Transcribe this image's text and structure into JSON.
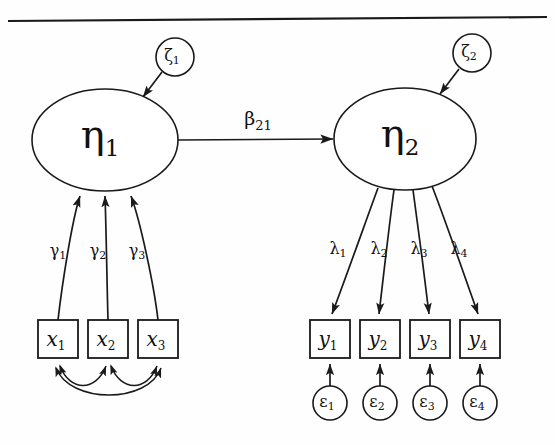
{
  "figure": {
    "type": "sem-path-diagram",
    "top_rule": true,
    "background_color": "#fefefe",
    "stroke_color": "#1a1a1a"
  },
  "latent_variables": [
    {
      "id": "eta1",
      "symbol": "η",
      "subscript": "1",
      "shape": "ellipse",
      "cx": 105,
      "cy": 140,
      "rx": 73,
      "ry": 51
    },
    {
      "id": "eta2",
      "symbol": "η",
      "subscript": "2",
      "shape": "ellipse",
      "cx": 405,
      "cy": 139,
      "rx": 71,
      "ry": 51
    }
  ],
  "disturbances": [
    {
      "id": "zeta1",
      "symbol": "ζ",
      "subscript": "1",
      "shape": "circle",
      "cx": 175,
      "cy": 57,
      "r": 19,
      "target": "eta1"
    },
    {
      "id": "zeta2",
      "symbol": "ζ",
      "subscript": "2",
      "shape": "circle",
      "cx": 472,
      "cy": 53,
      "r": 19,
      "target": "eta2"
    }
  ],
  "exogenous_indicators": [
    {
      "id": "x1",
      "symbol": "x",
      "subscript": "1",
      "x": 38,
      "y": 320,
      "w": 40,
      "h": 38
    },
    {
      "id": "x2",
      "symbol": "x",
      "subscript": "2",
      "x": 88,
      "y": 320,
      "w": 40,
      "h": 38
    },
    {
      "id": "x3",
      "symbol": "x",
      "subscript": "3",
      "x": 138,
      "y": 320,
      "w": 40,
      "h": 38
    }
  ],
  "endogenous_indicators": [
    {
      "id": "y1",
      "symbol": "y",
      "subscript": "1",
      "x": 310,
      "y": 320,
      "w": 40,
      "h": 38
    },
    {
      "id": "y2",
      "symbol": "y",
      "subscript": "2",
      "x": 360,
      "y": 320,
      "w": 40,
      "h": 38
    },
    {
      "id": "y3",
      "symbol": "y",
      "subscript": "3",
      "x": 410,
      "y": 320,
      "w": 40,
      "h": 38
    },
    {
      "id": "y4",
      "symbol": "y",
      "subscript": "4",
      "x": 460,
      "y": 320,
      "w": 40,
      "h": 38
    }
  ],
  "measurement_errors": [
    {
      "id": "epsilon1",
      "symbol": "ε",
      "subscript": "1",
      "cx": 330,
      "cy": 403,
      "r": 17,
      "target": "y1"
    },
    {
      "id": "epsilon2",
      "symbol": "ε",
      "subscript": "2",
      "cx": 380,
      "cy": 403,
      "r": 17,
      "target": "y2"
    },
    {
      "id": "epsilon3",
      "symbol": "ε",
      "subscript": "3",
      "cx": 430,
      "cy": 403,
      "r": 17,
      "target": "y3"
    },
    {
      "id": "epsilon4",
      "symbol": "ε",
      "subscript": "4",
      "cx": 480,
      "cy": 403,
      "r": 17,
      "target": "y4"
    }
  ],
  "gamma_paths": [
    {
      "id": "gamma1",
      "symbol": "γ",
      "subscript": "1",
      "from": "x1",
      "to": "eta1",
      "label_x": 58,
      "label_y": 251
    },
    {
      "id": "gamma2",
      "symbol": "γ",
      "subscript": "2",
      "from": "x2",
      "to": "eta1",
      "label_x": 98,
      "label_y": 251
    },
    {
      "id": "gamma3",
      "symbol": "γ",
      "subscript": "3",
      "from": "x3",
      "to": "eta1",
      "label_x": 137,
      "label_y": 251
    }
  ],
  "lambda_paths": [
    {
      "id": "lambda1",
      "symbol": "λ",
      "subscript": "1",
      "from": "eta2",
      "to": "y1",
      "label_x": 338,
      "label_y": 249
    },
    {
      "id": "lambda2",
      "symbol": "λ",
      "subscript": "2",
      "from": "eta2",
      "to": "y2",
      "label_x": 379,
      "label_y": 249
    },
    {
      "id": "lambda3",
      "symbol": "λ",
      "subscript": "3",
      "from": "eta2",
      "to": "y3",
      "label_x": 419,
      "label_y": 249
    },
    {
      "id": "lambda4",
      "symbol": "λ",
      "subscript": "4",
      "from": "eta2",
      "to": "y4",
      "label_x": 459,
      "label_y": 249
    }
  ],
  "structural_path": {
    "id": "beta21",
    "symbol": "β",
    "subscript": "21",
    "from": "eta1",
    "to": "eta2",
    "label_x": 258,
    "label_y": 120
  },
  "covariances": [
    {
      "id": "cov-x1-x2",
      "from": "x1",
      "to": "x2",
      "depth": "shallow"
    },
    {
      "id": "cov-x2-x3",
      "from": "x2",
      "to": "x3",
      "depth": "shallow"
    },
    {
      "id": "cov-x1-x3",
      "from": "x1",
      "to": "x3",
      "depth": "deep"
    }
  ]
}
